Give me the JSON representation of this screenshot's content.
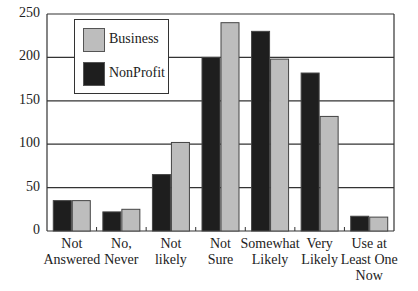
{
  "chart_data": {
    "type": "bar",
    "title": "",
    "xlabel": "",
    "ylabel": "",
    "ylim": [
      0,
      250
    ],
    "yticks": [
      0,
      50,
      100,
      150,
      200,
      250
    ],
    "grid": true,
    "legend_position": "upper-left inside",
    "categories": [
      "Not\nAnswered",
      "No,\nNever",
      "Not\nlikely",
      "Not\nSure",
      "Somewhat\nLikely",
      "Very\nLikely",
      "Use at\nLeast One\nNow"
    ],
    "series": [
      {
        "name": "NonProfit",
        "color": "#1e1e1e",
        "values": [
          35,
          22,
          65,
          200,
          230,
          182,
          17
        ]
      },
      {
        "name": "Business",
        "color": "#bdbdbd",
        "values": [
          35,
          25,
          102,
          240,
          198,
          132,
          16
        ]
      }
    ]
  },
  "legend": {
    "items": [
      {
        "label": "Business",
        "color": "#bdbdbd"
      },
      {
        "label": "NonProfit",
        "color": "#1e1e1e"
      }
    ]
  }
}
